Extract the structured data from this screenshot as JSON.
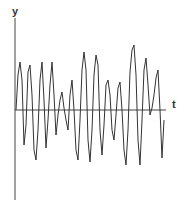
{
  "chart_data": {
    "type": "line",
    "title": "",
    "xlabel": "t",
    "ylabel": "y",
    "grid": false,
    "legend": null,
    "ticks": "none",
    "data_fidelity": "schematic-approximate",
    "note": "Unscaled schematic of an irregular oscillating signal y(t) about the t-axis. No ticks or numeric labels are shown, so no quantitative values can be read. The trace below is an approximate hand reconstruction of the waveform's shape, not measured data.",
    "approx_trace_pixels": {
      "description": "Approximate (x, y) pixel coordinates tracing the visible waveform shape; y grows downward; t-axis at y=110.",
      "points": [
        [
          16,
          110
        ],
        [
          18,
          75
        ],
        [
          20,
          62
        ],
        [
          22,
          80
        ],
        [
          24,
          145
        ],
        [
          26,
          125
        ],
        [
          28,
          72
        ],
        [
          30,
          65
        ],
        [
          32,
          95
        ],
        [
          34,
          150
        ],
        [
          36,
          160
        ],
        [
          38,
          130
        ],
        [
          40,
          80
        ],
        [
          42,
          62
        ],
        [
          44,
          100
        ],
        [
          46,
          148
        ],
        [
          48,
          120
        ],
        [
          50,
          85
        ],
        [
          52,
          62
        ],
        [
          54,
          95
        ],
        [
          56,
          135
        ],
        [
          58,
          115
        ],
        [
          60,
          100
        ],
        [
          62,
          92
        ],
        [
          64,
          108
        ],
        [
          66,
          120
        ],
        [
          68,
          130
        ],
        [
          70,
          95
        ],
        [
          72,
          80
        ],
        [
          74,
          110
        ],
        [
          76,
          150
        ],
        [
          78,
          160
        ],
        [
          80,
          120
        ],
        [
          82,
          70
        ],
        [
          84,
          52
        ],
        [
          86,
          70
        ],
        [
          88,
          140
        ],
        [
          90,
          162
        ],
        [
          92,
          130
        ],
        [
          94,
          75
        ],
        [
          96,
          55
        ],
        [
          98,
          65
        ],
        [
          100,
          130
        ],
        [
          102,
          155
        ],
        [
          104,
          125
        ],
        [
          106,
          85
        ],
        [
          108,
          80
        ],
        [
          110,
          95
        ],
        [
          112,
          130
        ],
        [
          114,
          140
        ],
        [
          116,
          115
        ],
        [
          118,
          88
        ],
        [
          120,
          82
        ],
        [
          122,
          110
        ],
        [
          124,
          150
        ],
        [
          126,
          165
        ],
        [
          128,
          130
        ],
        [
          130,
          72
        ],
        [
          132,
          50
        ],
        [
          134,
          45
        ],
        [
          136,
          75
        ],
        [
          138,
          140
        ],
        [
          140,
          165
        ],
        [
          142,
          120
        ],
        [
          144,
          70
        ],
        [
          146,
          58
        ],
        [
          148,
          85
        ],
        [
          150,
          115
        ],
        [
          152,
          108
        ],
        [
          154,
          95
        ],
        [
          156,
          78
        ],
        [
          158,
          70
        ],
        [
          160,
          110
        ],
        [
          162,
          158
        ],
        [
          164,
          120
        ]
      ]
    }
  },
  "labels": {
    "y_axis": "y",
    "t_axis": "t"
  },
  "colors": {
    "line": "#333333",
    "axis": "#444444",
    "background": "#ffffff"
  }
}
